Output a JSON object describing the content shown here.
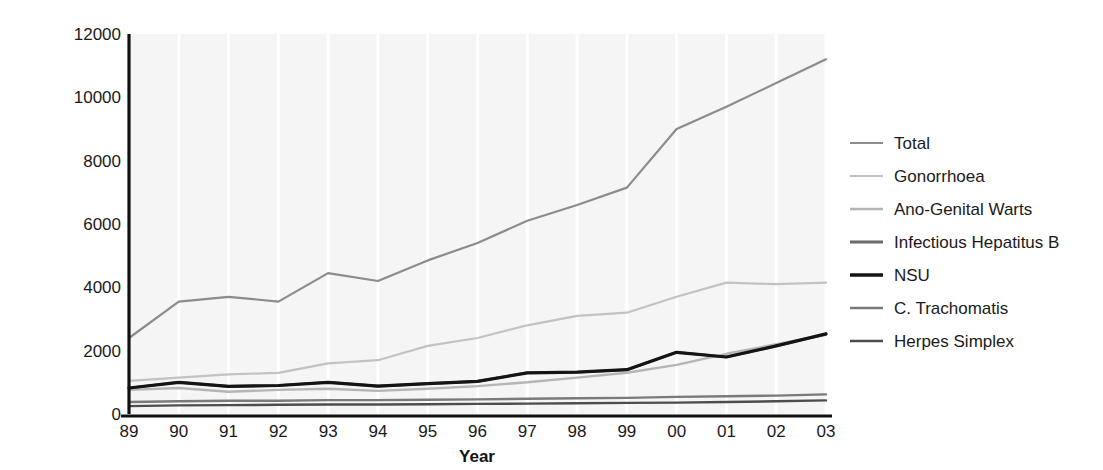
{
  "chart_data": {
    "type": "line",
    "title": "",
    "xlabel": "Year",
    "ylabel": "",
    "grid": true,
    "legend_position": "right",
    "xlim": [
      0,
      14
    ],
    "ylim": [
      0,
      12000
    ],
    "categories": [
      "89",
      "90",
      "91",
      "92",
      "93",
      "94",
      "95",
      "96",
      "97",
      "98",
      "99",
      "00",
      "01",
      "02",
      "03"
    ],
    "ytick_labels": [
      "0",
      "2000",
      "4000",
      "6000",
      "8000",
      "10000",
      "12000"
    ],
    "ytick_values": [
      0,
      2000,
      4000,
      6000,
      8000,
      10000,
      12000
    ],
    "series": [
      {
        "name": "Total",
        "color": "#8c8c8c",
        "width": 2.2,
        "values": [
          2400,
          3550,
          3700,
          3550,
          4450,
          4200,
          4850,
          5400,
          6100,
          6600,
          7150,
          9000,
          9700,
          10450,
          11200
        ]
      },
      {
        "name": "Gonorrhoea",
        "color": "#c2c2c2",
        "width": 2.2,
        "values": [
          1050,
          1150,
          1250,
          1300,
          1600,
          1700,
          2150,
          2400,
          2800,
          3100,
          3200,
          3700,
          4150,
          4100,
          4150
        ]
      },
      {
        "name": "Ano-Genital Warts",
        "color": "#b5b5b5",
        "width": 2.4,
        "values": [
          760,
          820,
          700,
          760,
          800,
          730,
          800,
          880,
          1000,
          1150,
          1300,
          1550,
          1900,
          2200,
          2500
        ]
      },
      {
        "name": "Infectious Hepatitus B",
        "color": "#6b6b6b",
        "width": 2.6,
        "values": [
          820,
          1000,
          870,
          900,
          1000,
          880,
          960,
          1030,
          1300,
          1320,
          1400,
          1950,
          1800,
          2150,
          2530
        ]
      },
      {
        "name": "NSU",
        "color": "#141414",
        "width": 3.2,
        "values": [
          820,
          1000,
          870,
          900,
          1000,
          880,
          960,
          1030,
          1300,
          1320,
          1400,
          1950,
          1800,
          2150,
          2530
        ]
      },
      {
        "name": "C. Trachomatis",
        "color": "#7a7a7a",
        "width": 2.4,
        "values": [
          380,
          400,
          420,
          420,
          440,
          440,
          450,
          460,
          480,
          500,
          510,
          540,
          560,
          580,
          620
        ]
      },
      {
        "name": "Herpes Simplex",
        "color": "#4d4d4d",
        "width": 2.4,
        "values": [
          250,
          270,
          280,
          290,
          300,
          300,
          310,
          320,
          330,
          340,
          350,
          360,
          380,
          400,
          430
        ]
      }
    ]
  },
  "legend": {
    "items": [
      {
        "label": "Total",
        "color": "#8c8c8c",
        "width": 2.2
      },
      {
        "label": "Gonorrhoea",
        "color": "#c2c2c2",
        "width": 2.2
      },
      {
        "label": "Ano-Genital Warts",
        "color": "#b5b5b5",
        "width": 2.4
      },
      {
        "label": "Infectious Hepatitus B",
        "color": "#6b6b6b",
        "width": 2.8
      },
      {
        "label": "NSU",
        "color": "#141414",
        "width": 3.6
      },
      {
        "label": "C. Trachomatis",
        "color": "#7a7a7a",
        "width": 2.4
      },
      {
        "label": "Herpes Simplex",
        "color": "#4d4d4d",
        "width": 2.4
      }
    ]
  }
}
